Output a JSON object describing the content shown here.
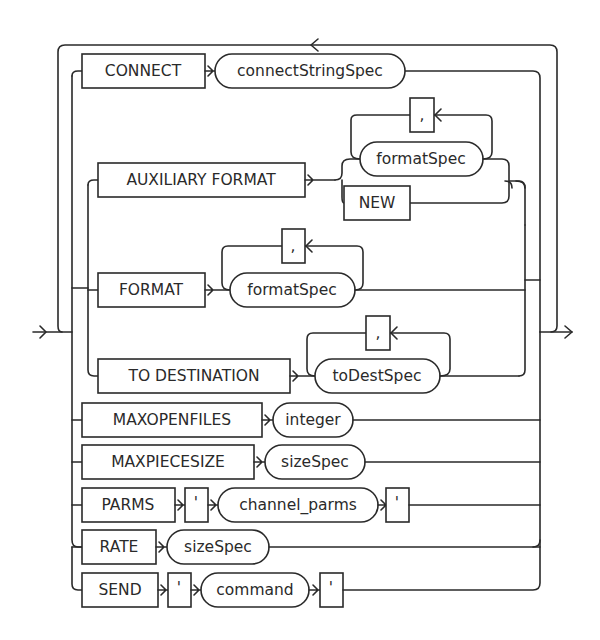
{
  "diagram": {
    "type": "railroad-syntax",
    "keywords": {
      "connect": "CONNECT",
      "auxiliary_format": "AUXILIARY FORMAT",
      "new": "NEW",
      "format": "FORMAT",
      "to_destination": "TO DESTINATION",
      "maxopenfiles": "MAXOPENFILES",
      "maxpiecesize": "MAXPIECESIZE",
      "parms": "PARMS",
      "rate": "RATE",
      "send": "SEND"
    },
    "nonterminals": {
      "connect_string_spec": "connectStringSpec",
      "format_spec_aux": "formatSpec",
      "format_spec": "formatSpec",
      "to_dest_spec": "toDestSpec",
      "integer": "integer",
      "size_spec_piece": "sizeSpec",
      "channel_parms": "channel_parms",
      "size_spec_rate": "sizeSpec",
      "command": "command"
    },
    "separators": {
      "comma_aux": ",",
      "comma_format": ",",
      "comma_dest": ",",
      "quote_parms_open": "'",
      "quote_parms_close": "'",
      "quote_send_open": "'",
      "quote_send_close": "'"
    }
  }
}
